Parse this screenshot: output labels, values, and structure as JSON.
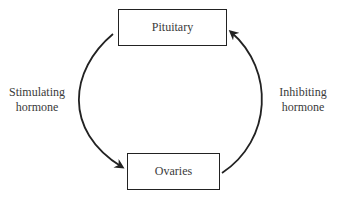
{
  "diagram": {
    "type": "feedback-loop",
    "nodes": {
      "top": {
        "label": "Pituitary"
      },
      "bottom": {
        "label": "Ovaries"
      }
    },
    "edges": {
      "left": {
        "from": "Pituitary",
        "to": "Ovaries",
        "line1": "Stimulating",
        "line2": "hormone"
      },
      "right": {
        "from": "Ovaries",
        "to": "Pituitary",
        "line1": "Inhibiting",
        "line2": "hormone"
      }
    },
    "colors": {
      "stroke": "#222222",
      "text": "#3a3a3a",
      "background": "#ffffff"
    }
  }
}
